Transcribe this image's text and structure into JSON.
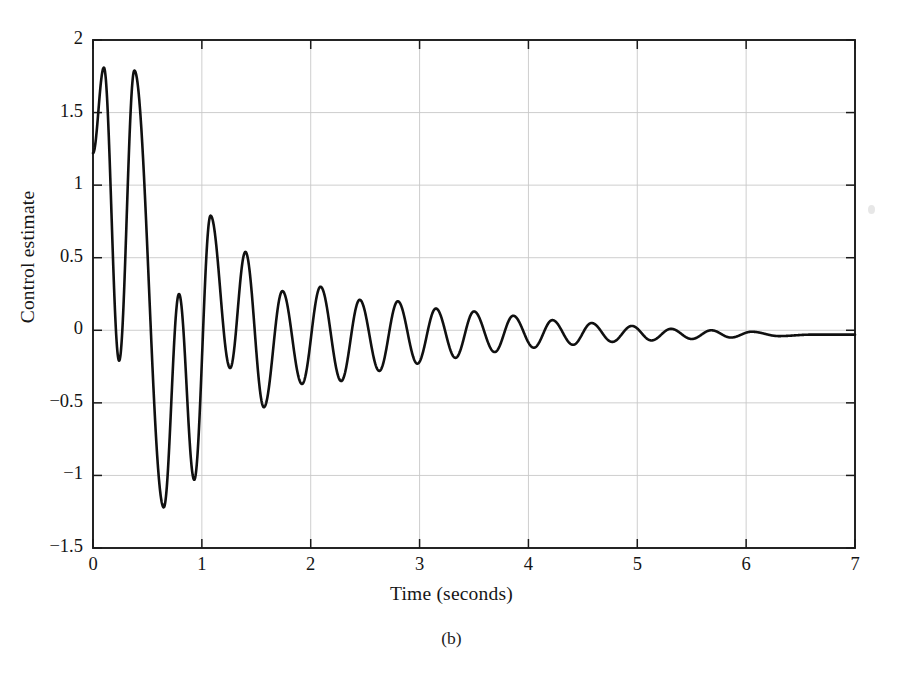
{
  "figure": {
    "caption": "(b)",
    "background_color": "#ffffff",
    "line_color": "#101010",
    "grid_color": "#c8c8c8",
    "axis_color": "#1a1a1a"
  },
  "chart_data": {
    "type": "line",
    "title": "",
    "xlabel": "Time (seconds)",
    "ylabel": "Control estimate",
    "xlim": [
      0,
      7
    ],
    "ylim": [
      -1.5,
      2
    ],
    "grid": true,
    "legend": null,
    "xticks": [
      0,
      1,
      2,
      3,
      4,
      5,
      6,
      7
    ],
    "xtick_labels": [
      "0",
      "1",
      "2",
      "3",
      "4",
      "5",
      "6",
      "7"
    ],
    "yticks": [
      -1.5,
      -1,
      -0.5,
      0,
      0.5,
      1,
      1.5,
      2
    ],
    "ytick_labels": [
      "−1.5",
      "−1",
      "−0.5",
      "0",
      "0.5",
      "1",
      "1.5",
      "2"
    ],
    "series": [
      {
        "name": "control estimate",
        "color": "#101010",
        "linewidth": 2.6,
        "description": "Damped oscillatory control-estimate signal settling near zero",
        "extrema": [
          {
            "t": 0.0,
            "value": 1.22,
            "kind": "start"
          },
          {
            "t": 0.1,
            "value": 1.81,
            "kind": "peak"
          },
          {
            "t": 0.24,
            "value": -0.21,
            "kind": "trough"
          },
          {
            "t": 0.38,
            "value": 1.79,
            "kind": "peak"
          },
          {
            "t": 0.65,
            "value": -1.22,
            "kind": "trough"
          },
          {
            "t": 0.79,
            "value": 0.25,
            "kind": "peak"
          },
          {
            "t": 0.93,
            "value": -1.03,
            "kind": "trough"
          },
          {
            "t": 1.08,
            "value": 0.79,
            "kind": "peak"
          },
          {
            "t": 1.26,
            "value": -0.26,
            "kind": "trough"
          },
          {
            "t": 1.4,
            "value": 0.54,
            "kind": "peak"
          },
          {
            "t": 1.57,
            "value": -0.53,
            "kind": "trough"
          },
          {
            "t": 1.74,
            "value": 0.27,
            "kind": "peak"
          },
          {
            "t": 1.92,
            "value": -0.37,
            "kind": "trough"
          },
          {
            "t": 2.09,
            "value": 0.3,
            "kind": "peak"
          },
          {
            "t": 2.28,
            "value": -0.35,
            "kind": "trough"
          },
          {
            "t": 2.45,
            "value": 0.21,
            "kind": "peak"
          },
          {
            "t": 2.63,
            "value": -0.28,
            "kind": "trough"
          },
          {
            "t": 2.8,
            "value": 0.2,
            "kind": "peak"
          },
          {
            "t": 2.98,
            "value": -0.23,
            "kind": "trough"
          },
          {
            "t": 3.15,
            "value": 0.15,
            "kind": "peak"
          },
          {
            "t": 3.33,
            "value": -0.19,
            "kind": "trough"
          },
          {
            "t": 3.5,
            "value": 0.13,
            "kind": "peak"
          },
          {
            "t": 3.69,
            "value": -0.15,
            "kind": "trough"
          },
          {
            "t": 3.86,
            "value": 0.1,
            "kind": "peak"
          },
          {
            "t": 4.05,
            "value": -0.12,
            "kind": "trough"
          },
          {
            "t": 4.22,
            "value": 0.07,
            "kind": "peak"
          },
          {
            "t": 4.41,
            "value": -0.1,
            "kind": "trough"
          },
          {
            "t": 4.58,
            "value": 0.05,
            "kind": "peak"
          },
          {
            "t": 4.77,
            "value": -0.08,
            "kind": "trough"
          },
          {
            "t": 4.95,
            "value": 0.03,
            "kind": "peak"
          },
          {
            "t": 5.13,
            "value": -0.07,
            "kind": "trough"
          },
          {
            "t": 5.31,
            "value": 0.01,
            "kind": "peak"
          },
          {
            "t": 5.5,
            "value": -0.06,
            "kind": "trough"
          },
          {
            "t": 5.68,
            "value": 0.0,
            "kind": "peak"
          },
          {
            "t": 5.86,
            "value": -0.05,
            "kind": "trough"
          },
          {
            "t": 6.05,
            "value": -0.01,
            "kind": "peak"
          },
          {
            "t": 6.3,
            "value": -0.04,
            "kind": "trough"
          },
          {
            "t": 6.6,
            "value": -0.03,
            "kind": "peak"
          },
          {
            "t": 7.0,
            "value": -0.03,
            "kind": "end"
          }
        ],
        "model": {
          "form": "offset + amplitude*exp(-decay*t)*sin(omega*t + phase)",
          "offset": -0.03,
          "amplitude": 1.95,
          "decay": 1.62,
          "omega": 22.4,
          "phase": 0.68
        }
      }
    ]
  }
}
